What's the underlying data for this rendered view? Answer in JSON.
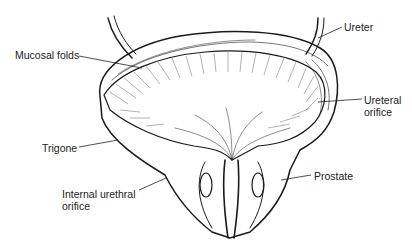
{
  "figure": {
    "colors": {
      "ink": "#1a1a1a",
      "background": "#ffffff"
    },
    "labels": [
      {
        "id": "mucosal-folds",
        "lines": [
          "Mucosal folds"
        ],
        "x": 15,
        "y": 49
      },
      {
        "id": "ureter",
        "lines": [
          "Ureter"
        ],
        "x": 344,
        "y": 21
      },
      {
        "id": "ureteral-orifice",
        "lines": [
          "Ureteral",
          "orifice"
        ],
        "x": 364,
        "y": 94
      },
      {
        "id": "trigone",
        "lines": [
          "Trigone"
        ],
        "x": 42,
        "y": 142
      },
      {
        "id": "internal-urethral-orifice",
        "lines": [
          "Internal urethral",
          "orifice"
        ],
        "x": 62,
        "y": 188
      },
      {
        "id": "prostate",
        "lines": [
          "Prostate"
        ],
        "x": 314,
        "y": 170
      }
    ]
  }
}
